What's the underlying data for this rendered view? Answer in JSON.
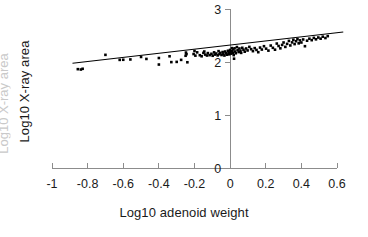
{
  "chart_data": {
    "type": "scatter",
    "title": "",
    "xlabel": "Log10 adenoid weight",
    "ylabel": "Log10 X-ray area",
    "xlim": [
      -1.0,
      0.6
    ],
    "ylim": [
      0,
      3
    ],
    "xticks": [
      -1,
      -0.8,
      -0.6,
      -0.4,
      -0.2,
      0,
      0.2,
      0.4,
      0.6
    ],
    "xticklabels": [
      "-1",
      "-0.8",
      "-0.6",
      "-0.4",
      "-0.2",
      "0",
      "0.2",
      "0.4",
      "0.6"
    ],
    "yticks": [
      0,
      1,
      2,
      3
    ],
    "yticklabels": [
      "0",
      "1",
      "2",
      "3"
    ],
    "grid": false,
    "legend": null,
    "marker": {
      "shape": "square",
      "color": "#000000",
      "size": 2.6
    },
    "trendline": {
      "type": "linear",
      "color": "#000000",
      "x_start": -0.885,
      "y_start": 1.975,
      "x_end": 0.635,
      "y_end": 2.565,
      "slope": 0.388,
      "intercept": 2.318
    },
    "points": [
      [
        -0.855,
        1.865
      ],
      [
        -0.838,
        1.858
      ],
      [
        -0.828,
        1.872
      ],
      [
        -0.7,
        2.135
      ],
      [
        -0.62,
        2.04
      ],
      [
        -0.6,
        2.042
      ],
      [
        -0.56,
        2.048
      ],
      [
        -0.5,
        2.095
      ],
      [
        -0.47,
        2.058
      ],
      [
        -0.4,
        2.075
      ],
      [
        -0.4,
        1.952
      ],
      [
        -0.34,
        2.108
      ],
      [
        -0.33,
        1.998
      ],
      [
        -0.3,
        2.002
      ],
      [
        -0.275,
        2.04
      ],
      [
        -0.25,
        2.118
      ],
      [
        -0.248,
        2.178
      ],
      [
        -0.245,
        2.148
      ],
      [
        -0.24,
        1.995
      ],
      [
        -0.205,
        2.15
      ],
      [
        -0.2,
        2.208
      ],
      [
        -0.195,
        2.12
      ],
      [
        -0.185,
        2.182
      ],
      [
        -0.17,
        2.128
      ],
      [
        -0.16,
        2.108
      ],
      [
        -0.15,
        2.172
      ],
      [
        -0.145,
        2.198
      ],
      [
        -0.14,
        2.14
      ],
      [
        -0.13,
        2.122
      ],
      [
        -0.125,
        2.168
      ],
      [
        -0.115,
        2.13
      ],
      [
        -0.105,
        2.155
      ],
      [
        -0.098,
        2.118
      ],
      [
        -0.09,
        2.182
      ],
      [
        -0.085,
        2.14
      ],
      [
        -0.078,
        2.16
      ],
      [
        -0.07,
        2.125
      ],
      [
        -0.065,
        2.205
      ],
      [
        -0.06,
        2.148
      ],
      [
        -0.055,
        2.172
      ],
      [
        -0.048,
        2.132
      ],
      [
        -0.042,
        2.188
      ],
      [
        -0.038,
        2.152
      ],
      [
        -0.032,
        2.122
      ],
      [
        -0.028,
        2.198
      ],
      [
        -0.022,
        2.165
      ],
      [
        -0.018,
        2.138
      ],
      [
        -0.012,
        2.212
      ],
      [
        -0.008,
        2.178
      ],
      [
        -0.005,
        2.145
      ],
      [
        0.0,
        2.228
      ],
      [
        0.002,
        2.192
      ],
      [
        0.006,
        2.158
      ],
      [
        0.01,
        2.262
      ],
      [
        0.012,
        2.205
      ],
      [
        0.015,
        2.172
      ],
      [
        0.018,
        2.24
      ],
      [
        0.02,
        2.13
      ],
      [
        0.022,
        2.062
      ],
      [
        0.025,
        2.258
      ],
      [
        0.028,
        2.198
      ],
      [
        0.032,
        2.165
      ],
      [
        0.038,
        2.282
      ],
      [
        0.042,
        2.225
      ],
      [
        0.048,
        2.188
      ],
      [
        0.052,
        2.255
      ],
      [
        0.058,
        2.212
      ],
      [
        0.062,
        2.172
      ],
      [
        0.068,
        2.268
      ],
      [
        0.075,
        2.232
      ],
      [
        0.082,
        2.195
      ],
      [
        0.09,
        2.255
      ],
      [
        0.098,
        2.218
      ],
      [
        0.108,
        2.285
      ],
      [
        0.118,
        2.242
      ],
      [
        0.128,
        2.205
      ],
      [
        0.138,
        2.262
      ],
      [
        0.148,
        2.228
      ],
      [
        0.158,
        2.185
      ],
      [
        0.168,
        2.272
      ],
      [
        0.178,
        2.235
      ],
      [
        0.19,
        2.298
      ],
      [
        0.202,
        2.252
      ],
      [
        0.215,
        2.215
      ],
      [
        0.228,
        2.31
      ],
      [
        0.24,
        2.268
      ],
      [
        0.252,
        2.232
      ],
      [
        0.262,
        2.348
      ],
      [
        0.272,
        2.302
      ],
      [
        0.282,
        2.258
      ],
      [
        0.292,
        2.322
      ],
      [
        0.3,
        2.368
      ],
      [
        0.31,
        2.285
      ],
      [
        0.32,
        2.342
      ],
      [
        0.33,
        2.398
      ],
      [
        0.338,
        2.312
      ],
      [
        0.348,
        2.37
      ],
      [
        0.355,
        2.42
      ],
      [
        0.362,
        2.338
      ],
      [
        0.37,
        2.392
      ],
      [
        0.378,
        2.432
      ],
      [
        0.385,
        2.352
      ],
      [
        0.392,
        2.408
      ],
      [
        0.4,
        2.368
      ],
      [
        0.41,
        2.425
      ],
      [
        0.42,
        2.298
      ],
      [
        0.432,
        2.402
      ],
      [
        0.445,
        2.44
      ],
      [
        0.458,
        2.412
      ],
      [
        0.47,
        2.455
      ],
      [
        0.482,
        2.428
      ],
      [
        0.495,
        2.462
      ],
      [
        0.508,
        2.44
      ],
      [
        0.52,
        2.478
      ],
      [
        0.535,
        2.452
      ],
      [
        0.548,
        2.488
      ]
    ]
  },
  "axis": {
    "x_title": "Log10 adenoid weight",
    "y_title": "Log10 X-ray area",
    "y_title_ghost": "Log10 X-ray area"
  }
}
